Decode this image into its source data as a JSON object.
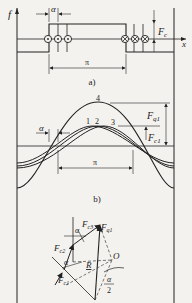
{
  "figure": {
    "panel_a": {
      "caption": "a)",
      "y_axis_label": "f",
      "x_axis_label": "x",
      "alpha_label": "α",
      "force_label_main": "F",
      "force_label_sub": "c",
      "pitch_label": "π",
      "left_conductors": "⊙",
      "right_conductors": "⊗"
    },
    "panel_b": {
      "caption": "b)",
      "curve_labels": [
        "1",
        "2",
        "3",
        "4"
      ],
      "alpha_label": "α",
      "fq1_main": "F",
      "fq1_sub": "q1",
      "fc1_main": "F",
      "fc1_sub": "c1",
      "pitch_label": "π"
    },
    "panel_c": {
      "fc1_main": "F",
      "fc1_sub": "c1",
      "fc2_main": "F",
      "fc2_sub": "c2",
      "fc3_main": "F",
      "fc3_sub": "c3",
      "fq1_main": "F",
      "fq1_sub": "q1",
      "alpha_label_1": "α",
      "alpha_label_2": "α",
      "radius_label": "R",
      "center_label": "O",
      "half_alpha_num": "α",
      "half_alpha_den": "2"
    },
    "colors": {
      "ink": "#222222",
      "background": "#f4f2ef"
    }
  }
}
